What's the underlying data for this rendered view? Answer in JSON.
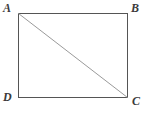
{
  "figure": {
    "kind": "geometry-diagram",
    "shape_name": "rectangle",
    "background_color": "#ffffff",
    "rectangle": {
      "stroke_color": "#555555",
      "stroke_width": 1,
      "fill": "none",
      "x": 18,
      "y": 13,
      "width": 110,
      "height": 85,
      "corners": {
        "top_left": [
          18,
          13
        ],
        "top_right": [
          128,
          13
        ],
        "bottom_right": [
          128,
          98
        ],
        "bottom_left": [
          18,
          98
        ]
      }
    },
    "diagonal": {
      "from": "A",
      "to": "C",
      "from_point": [
        18,
        13
      ],
      "to_point": [
        128,
        98
      ],
      "stroke_color": "#9a9a9a",
      "stroke_width": 1
    },
    "labels": [
      {
        "text": "A",
        "vertex": "top-left",
        "color": "#3b3b3b"
      },
      {
        "text": "B",
        "vertex": "top-right",
        "color": "#3b3b3b"
      },
      {
        "text": "C",
        "vertex": "bottom-right",
        "color": "#3b3b3b"
      },
      {
        "text": "D",
        "vertex": "bottom-left",
        "color": "#3b3b3b"
      }
    ]
  }
}
